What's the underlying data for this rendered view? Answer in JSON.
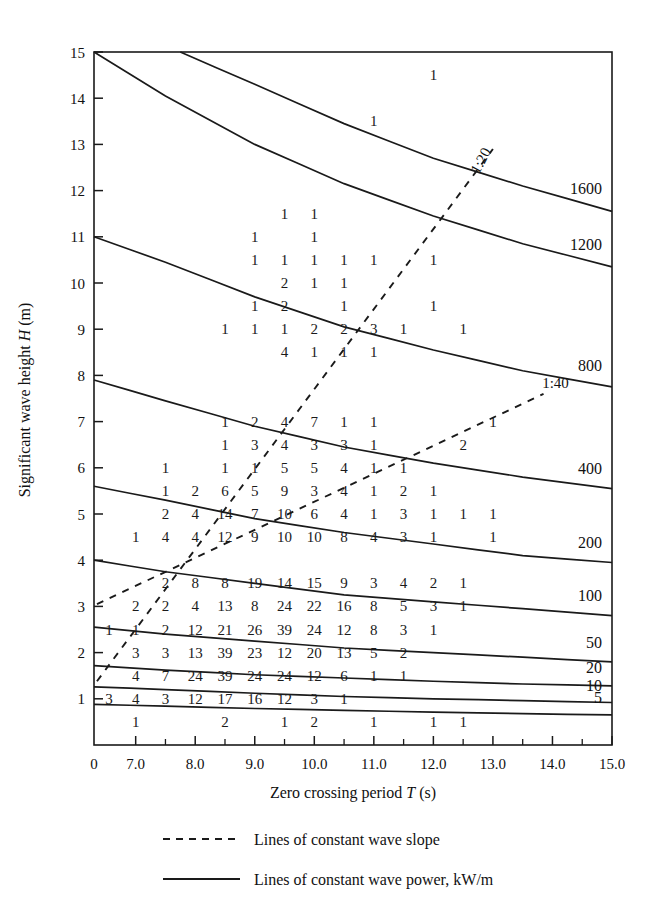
{
  "figure": {
    "xaxis": {
      "title_prefix": "Zero crossing period ",
      "title_symbol": "T",
      "title_suffix": " (s)",
      "tick_labels": [
        "0",
        "7.0",
        "8.0",
        "9.0",
        "10.0",
        "11.0",
        "12.0",
        "13.0",
        "14.0",
        "15.0"
      ],
      "tick_values": [
        0,
        7,
        8,
        9,
        10,
        11,
        12,
        13,
        14,
        15
      ]
    },
    "yaxis": {
      "title_prefix": "Significant wave height ",
      "title_symbol": "H",
      "title_suffix": " (m)",
      "tick_labels": [
        "1",
        "2",
        "3",
        "4",
        "5",
        "6",
        "7",
        "8",
        "9",
        "10",
        "11",
        "12",
        "13",
        "14",
        "15"
      ],
      "tick_values": [
        1,
        2,
        3,
        4,
        5,
        6,
        7,
        8,
        9,
        10,
        11,
        12,
        13,
        14,
        15
      ]
    },
    "legend": [
      {
        "key": "dashed",
        "label": "Lines of constant wave slope"
      },
      {
        "key": "solid",
        "label": "Lines of constant wave power, kW/m"
      }
    ],
    "slope_labels": [
      "1:20",
      "1:40"
    ],
    "power_labels": [
      "1600",
      "1200",
      "800",
      "400",
      "200",
      "100",
      "50",
      "20",
      "10",
      "5"
    ]
  },
  "chart_data": {
    "type": "scatter",
    "title": "",
    "subtitle": "",
    "xlabel": "Zero crossing period T (s)",
    "ylabel": "Significant wave height H (m)",
    "xlim": [
      6.3,
      15.0
    ],
    "ylim": [
      0.0,
      15.0
    ],
    "grid": false,
    "legend_position": "below-axes",
    "bin_centers_x": [
      6.55,
      7.0,
      7.5,
      8.0,
      8.5,
      9.0,
      9.5,
      10.0,
      10.5,
      11.0,
      11.5,
      12.0,
      12.5,
      13.0,
      13.5,
      14.0,
      14.5
    ],
    "bin_centers_y": [
      0.5,
      1.0,
      1.5,
      2.0,
      2.5,
      3.0,
      3.5,
      4.0,
      4.5,
      5.0,
      5.5,
      6.0,
      6.5,
      7.0,
      7.5,
      8.0,
      8.5,
      9.0,
      9.5,
      10.0,
      10.5,
      11.0,
      11.5,
      12.0,
      12.5,
      13.0,
      13.5,
      14.0,
      14.5
    ],
    "points": [
      {
        "x": 6.55,
        "y": 1.0,
        "v": 3
      },
      {
        "x": 7.0,
        "y": 1.0,
        "v": 4
      },
      {
        "x": 7.5,
        "y": 1.0,
        "v": 3
      },
      {
        "x": 8.0,
        "y": 1.0,
        "v": 12
      },
      {
        "x": 8.5,
        "y": 1.0,
        "v": 17
      },
      {
        "x": 9.0,
        "y": 1.0,
        "v": 16
      },
      {
        "x": 9.5,
        "y": 1.0,
        "v": 12
      },
      {
        "x": 10.0,
        "y": 1.0,
        "v": 3
      },
      {
        "x": 10.5,
        "y": 1.0,
        "v": 1
      },
      {
        "x": 7.0,
        "y": 0.5,
        "v": 1
      },
      {
        "x": 8.5,
        "y": 0.5,
        "v": 2
      },
      {
        "x": 9.5,
        "y": 0.5,
        "v": 1
      },
      {
        "x": 10.0,
        "y": 0.5,
        "v": 2
      },
      {
        "x": 11.0,
        "y": 0.5,
        "v": 1
      },
      {
        "x": 12.0,
        "y": 0.5,
        "v": 1
      },
      {
        "x": 12.5,
        "y": 0.5,
        "v": 1
      },
      {
        "x": 7.0,
        "y": 1.5,
        "v": 4
      },
      {
        "x": 7.5,
        "y": 1.5,
        "v": 7
      },
      {
        "x": 8.0,
        "y": 1.5,
        "v": 24
      },
      {
        "x": 8.5,
        "y": 1.5,
        "v": 39
      },
      {
        "x": 9.0,
        "y": 1.5,
        "v": 24
      },
      {
        "x": 9.5,
        "y": 1.5,
        "v": 24
      },
      {
        "x": 10.0,
        "y": 1.5,
        "v": 12
      },
      {
        "x": 10.5,
        "y": 1.5,
        "v": 6
      },
      {
        "x": 11.0,
        "y": 1.5,
        "v": 1
      },
      {
        "x": 11.5,
        "y": 1.5,
        "v": 1
      },
      {
        "x": 7.0,
        "y": 2.0,
        "v": 3
      },
      {
        "x": 7.5,
        "y": 2.0,
        "v": 3
      },
      {
        "x": 8.0,
        "y": 2.0,
        "v": 13
      },
      {
        "x": 8.5,
        "y": 2.0,
        "v": 39
      },
      {
        "x": 9.0,
        "y": 2.0,
        "v": 23
      },
      {
        "x": 9.5,
        "y": 2.0,
        "v": 12
      },
      {
        "x": 10.0,
        "y": 2.0,
        "v": 20
      },
      {
        "x": 10.5,
        "y": 2.0,
        "v": 13
      },
      {
        "x": 11.0,
        "y": 2.0,
        "v": 5
      },
      {
        "x": 11.5,
        "y": 2.0,
        "v": 2
      },
      {
        "x": 6.55,
        "y": 2.5,
        "v": 1
      },
      {
        "x": 7.0,
        "y": 2.5,
        "v": 1
      },
      {
        "x": 7.5,
        "y": 2.5,
        "v": 2
      },
      {
        "x": 8.0,
        "y": 2.5,
        "v": 12
      },
      {
        "x": 8.5,
        "y": 2.5,
        "v": 21
      },
      {
        "x": 9.0,
        "y": 2.5,
        "v": 26
      },
      {
        "x": 9.5,
        "y": 2.5,
        "v": 39
      },
      {
        "x": 10.0,
        "y": 2.5,
        "v": 24
      },
      {
        "x": 10.5,
        "y": 2.5,
        "v": 12
      },
      {
        "x": 11.0,
        "y": 2.5,
        "v": 8
      },
      {
        "x": 11.5,
        "y": 2.5,
        "v": 3
      },
      {
        "x": 12.0,
        "y": 2.5,
        "v": 1
      },
      {
        "x": 7.0,
        "y": 3.0,
        "v": 2
      },
      {
        "x": 7.5,
        "y": 3.0,
        "v": 2
      },
      {
        "x": 8.0,
        "y": 3.0,
        "v": 4
      },
      {
        "x": 8.5,
        "y": 3.0,
        "v": 13
      },
      {
        "x": 9.0,
        "y": 3.0,
        "v": 8
      },
      {
        "x": 9.5,
        "y": 3.0,
        "v": 24
      },
      {
        "x": 10.0,
        "y": 3.0,
        "v": 22
      },
      {
        "x": 10.5,
        "y": 3.0,
        "v": 16
      },
      {
        "x": 11.0,
        "y": 3.0,
        "v": 8
      },
      {
        "x": 11.5,
        "y": 3.0,
        "v": 5
      },
      {
        "x": 12.0,
        "y": 3.0,
        "v": 3
      },
      {
        "x": 12.5,
        "y": 3.0,
        "v": 1
      },
      {
        "x": 7.5,
        "y": 3.5,
        "v": 2
      },
      {
        "x": 8.0,
        "y": 3.5,
        "v": 8
      },
      {
        "x": 8.5,
        "y": 3.5,
        "v": 8
      },
      {
        "x": 9.0,
        "y": 3.5,
        "v": 19
      },
      {
        "x": 9.5,
        "y": 3.5,
        "v": 14
      },
      {
        "x": 10.0,
        "y": 3.5,
        "v": 15
      },
      {
        "x": 10.5,
        "y": 3.5,
        "v": 9
      },
      {
        "x": 11.0,
        "y": 3.5,
        "v": 3
      },
      {
        "x": 11.5,
        "y": 3.5,
        "v": 4
      },
      {
        "x": 12.0,
        "y": 3.5,
        "v": 2
      },
      {
        "x": 12.5,
        "y": 3.5,
        "v": 1
      },
      {
        "x": 7.0,
        "y": 4.5,
        "v": 1
      },
      {
        "x": 7.5,
        "y": 4.5,
        "v": 4
      },
      {
        "x": 8.0,
        "y": 4.5,
        "v": 4
      },
      {
        "x": 8.5,
        "y": 4.5,
        "v": 12
      },
      {
        "x": 9.0,
        "y": 4.5,
        "v": 9
      },
      {
        "x": 9.5,
        "y": 4.5,
        "v": 10
      },
      {
        "x": 10.0,
        "y": 4.5,
        "v": 10
      },
      {
        "x": 10.5,
        "y": 4.5,
        "v": 8
      },
      {
        "x": 11.0,
        "y": 4.5,
        "v": 4
      },
      {
        "x": 11.5,
        "y": 4.5,
        "v": 3
      },
      {
        "x": 12.0,
        "y": 4.5,
        "v": 1
      },
      {
        "x": 13.0,
        "y": 4.5,
        "v": 1
      },
      {
        "x": 7.5,
        "y": 5.0,
        "v": 2
      },
      {
        "x": 8.0,
        "y": 5.0,
        "v": 4
      },
      {
        "x": 8.5,
        "y": 5.0,
        "v": 14
      },
      {
        "x": 9.0,
        "y": 5.0,
        "v": 7
      },
      {
        "x": 9.5,
        "y": 5.0,
        "v": 10
      },
      {
        "x": 10.0,
        "y": 5.0,
        "v": 6
      },
      {
        "x": 10.5,
        "y": 5.0,
        "v": 4
      },
      {
        "x": 11.0,
        "y": 5.0,
        "v": 1
      },
      {
        "x": 11.5,
        "y": 5.0,
        "v": 3
      },
      {
        "x": 12.0,
        "y": 5.0,
        "v": 1
      },
      {
        "x": 12.5,
        "y": 5.0,
        "v": 1
      },
      {
        "x": 13.0,
        "y": 5.0,
        "v": 1
      },
      {
        "x": 7.5,
        "y": 5.5,
        "v": 1
      },
      {
        "x": 8.0,
        "y": 5.5,
        "v": 2
      },
      {
        "x": 8.5,
        "y": 5.5,
        "v": 6
      },
      {
        "x": 9.0,
        "y": 5.5,
        "v": 5
      },
      {
        "x": 9.5,
        "y": 5.5,
        "v": 9
      },
      {
        "x": 10.0,
        "y": 5.5,
        "v": 3
      },
      {
        "x": 10.5,
        "y": 5.5,
        "v": 4
      },
      {
        "x": 11.0,
        "y": 5.5,
        "v": 1
      },
      {
        "x": 11.5,
        "y": 5.5,
        "v": 2
      },
      {
        "x": 12.0,
        "y": 5.5,
        "v": 1
      },
      {
        "x": 7.5,
        "y": 6.0,
        "v": 1
      },
      {
        "x": 8.5,
        "y": 6.0,
        "v": 1
      },
      {
        "x": 9.0,
        "y": 6.0,
        "v": 1
      },
      {
        "x": 9.5,
        "y": 6.0,
        "v": 5
      },
      {
        "x": 10.0,
        "y": 6.0,
        "v": 5
      },
      {
        "x": 10.5,
        "y": 6.0,
        "v": 4
      },
      {
        "x": 11.0,
        "y": 6.0,
        "v": 1
      },
      {
        "x": 11.5,
        "y": 6.0,
        "v": 1
      },
      {
        "x": 8.5,
        "y": 6.5,
        "v": 1
      },
      {
        "x": 9.0,
        "y": 6.5,
        "v": 3
      },
      {
        "x": 9.5,
        "y": 6.5,
        "v": 4
      },
      {
        "x": 10.0,
        "y": 6.5,
        "v": 3
      },
      {
        "x": 10.5,
        "y": 6.5,
        "v": 3
      },
      {
        "x": 11.0,
        "y": 6.5,
        "v": 1
      },
      {
        "x": 12.5,
        "y": 6.5,
        "v": 2
      },
      {
        "x": 8.5,
        "y": 7.0,
        "v": 1
      },
      {
        "x": 9.0,
        "y": 7.0,
        "v": 2
      },
      {
        "x": 9.5,
        "y": 7.0,
        "v": 4
      },
      {
        "x": 10.0,
        "y": 7.0,
        "v": 7
      },
      {
        "x": 10.5,
        "y": 7.0,
        "v": 1
      },
      {
        "x": 11.0,
        "y": 7.0,
        "v": 1
      },
      {
        "x": 13.0,
        "y": 7.0,
        "v": 1
      },
      {
        "x": 9.5,
        "y": 8.5,
        "v": 4
      },
      {
        "x": 10.0,
        "y": 8.5,
        "v": 1
      },
      {
        "x": 10.5,
        "y": 8.5,
        "v": 1
      },
      {
        "x": 11.0,
        "y": 8.5,
        "v": 1
      },
      {
        "x": 8.5,
        "y": 9.0,
        "v": 1
      },
      {
        "x": 9.0,
        "y": 9.0,
        "v": 1
      },
      {
        "x": 9.5,
        "y": 9.0,
        "v": 1
      },
      {
        "x": 10.0,
        "y": 9.0,
        "v": 2
      },
      {
        "x": 10.5,
        "y": 9.0,
        "v": 2
      },
      {
        "x": 11.0,
        "y": 9.0,
        "v": 3
      },
      {
        "x": 11.5,
        "y": 9.0,
        "v": 1
      },
      {
        "x": 12.5,
        "y": 9.0,
        "v": 1
      },
      {
        "x": 9.0,
        "y": 9.5,
        "v": 1
      },
      {
        "x": 9.5,
        "y": 9.5,
        "v": 2
      },
      {
        "x": 10.5,
        "y": 9.5,
        "v": 1
      },
      {
        "x": 12.0,
        "y": 9.5,
        "v": 1
      },
      {
        "x": 9.5,
        "y": 10.0,
        "v": 2
      },
      {
        "x": 10.0,
        "y": 10.0,
        "v": 1
      },
      {
        "x": 10.5,
        "y": 10.0,
        "v": 1
      },
      {
        "x": 9.0,
        "y": 10.5,
        "v": 1
      },
      {
        "x": 9.5,
        "y": 10.5,
        "v": 1
      },
      {
        "x": 10.0,
        "y": 10.5,
        "v": 1
      },
      {
        "x": 10.5,
        "y": 10.5,
        "v": 1
      },
      {
        "x": 11.0,
        "y": 10.5,
        "v": 1
      },
      {
        "x": 12.0,
        "y": 10.5,
        "v": 1
      },
      {
        "x": 9.0,
        "y": 11.0,
        "v": 1
      },
      {
        "x": 10.0,
        "y": 11.0,
        "v": 1
      },
      {
        "x": 9.5,
        "y": 11.5,
        "v": 1
      },
      {
        "x": 10.0,
        "y": 11.5,
        "v": 1
      },
      {
        "x": 11.0,
        "y": 13.5,
        "v": 1
      },
      {
        "x": 12.0,
        "y": 14.5,
        "v": 1
      }
    ],
    "power_contours": [
      {
        "label": "1600",
        "points": [
          [
            7.75,
            15.0
          ],
          [
            9.0,
            14.3
          ],
          [
            10.5,
            13.45
          ],
          [
            12.0,
            12.7
          ],
          [
            13.5,
            12.1
          ],
          [
            15.0,
            11.55
          ]
        ]
      },
      {
        "label": "1200",
        "points": [
          [
            6.3,
            15.0
          ],
          [
            7.5,
            14.05
          ],
          [
            9.0,
            13.0
          ],
          [
            10.5,
            12.15
          ],
          [
            12.0,
            11.45
          ],
          [
            13.5,
            10.85
          ],
          [
            15.0,
            10.35
          ]
        ]
      },
      {
        "label": "800",
        "points": [
          [
            6.3,
            11.0
          ],
          [
            7.5,
            10.45
          ],
          [
            9.0,
            9.7
          ],
          [
            10.5,
            9.05
          ],
          [
            12.0,
            8.55
          ],
          [
            13.5,
            8.1
          ],
          [
            15.0,
            7.75
          ]
        ]
      },
      {
        "label": "400",
        "points": [
          [
            6.3,
            7.9
          ],
          [
            7.5,
            7.45
          ],
          [
            9.0,
            6.9
          ],
          [
            10.5,
            6.45
          ],
          [
            12.0,
            6.1
          ],
          [
            13.5,
            5.8
          ],
          [
            15.0,
            5.55
          ]
        ]
      },
      {
        "label": "200",
        "points": [
          [
            6.3,
            5.6
          ],
          [
            7.5,
            5.3
          ],
          [
            9.0,
            4.9
          ],
          [
            10.5,
            4.6
          ],
          [
            12.0,
            4.35
          ],
          [
            13.5,
            4.1
          ],
          [
            15.0,
            3.95
          ]
        ]
      },
      {
        "label": "100",
        "points": [
          [
            6.3,
            4.0
          ],
          [
            7.5,
            3.75
          ],
          [
            9.0,
            3.5
          ],
          [
            10.5,
            3.25
          ],
          [
            12.0,
            3.1
          ],
          [
            13.5,
            2.95
          ],
          [
            15.0,
            2.8
          ]
        ]
      },
      {
        "label": "50",
        "points": [
          [
            6.3,
            2.55
          ],
          [
            7.5,
            2.4
          ],
          [
            9.0,
            2.25
          ],
          [
            10.5,
            2.1
          ],
          [
            12.0,
            2.0
          ],
          [
            13.5,
            1.9
          ],
          [
            15.0,
            1.8
          ]
        ]
      },
      {
        "label": "20",
        "points": [
          [
            6.3,
            1.72
          ],
          [
            7.5,
            1.62
          ],
          [
            9.0,
            1.52
          ],
          [
            10.5,
            1.45
          ],
          [
            12.0,
            1.38
          ],
          [
            13.5,
            1.32
          ],
          [
            15.0,
            1.28
          ]
        ]
      },
      {
        "label": "10",
        "points": [
          [
            6.3,
            1.26
          ],
          [
            7.5,
            1.2
          ],
          [
            9.0,
            1.12
          ],
          [
            10.5,
            1.05
          ],
          [
            12.0,
            1.0
          ],
          [
            13.5,
            0.96
          ],
          [
            15.0,
            0.92
          ]
        ]
      },
      {
        "label": "5",
        "points": [
          [
            6.3,
            0.88
          ],
          [
            7.5,
            0.84
          ],
          [
            9.0,
            0.79
          ],
          [
            10.5,
            0.75
          ],
          [
            12.0,
            0.71
          ],
          [
            13.5,
            0.68
          ],
          [
            15.0,
            0.65
          ]
        ]
      }
    ],
    "slope_lines": [
      {
        "label": "1:20",
        "points": [
          [
            6.35,
            1.38
          ],
          [
            13.0,
            12.9
          ]
        ]
      },
      {
        "label": "1:40",
        "points": [
          [
            6.35,
            3.05
          ],
          [
            13.85,
            7.6
          ]
        ]
      }
    ]
  }
}
